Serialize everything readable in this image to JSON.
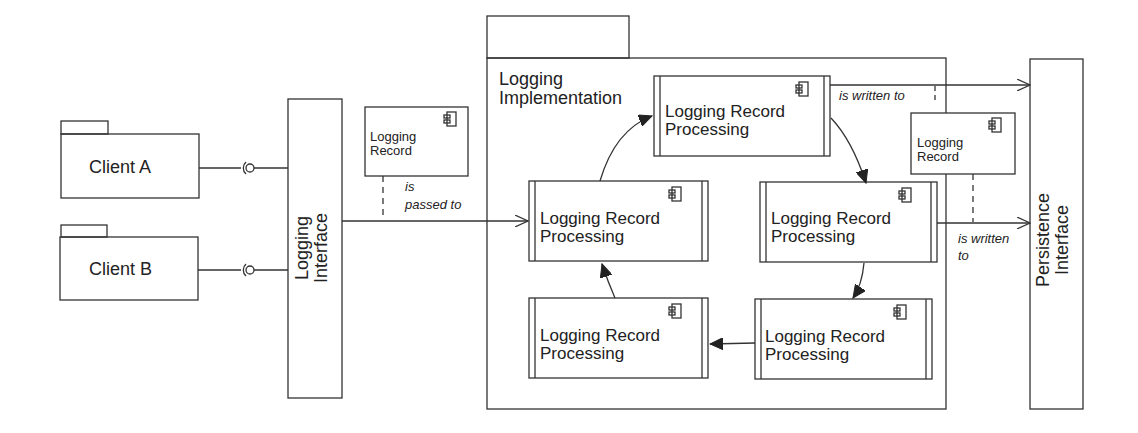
{
  "diagram": {
    "type": "UML component/package diagram",
    "clients": [
      {
        "label": "Client A"
      },
      {
        "label": "Client B"
      }
    ],
    "logging_interface": {
      "label_line1": "Logging",
      "label_line2": "Interface"
    },
    "persistence_interface": {
      "label_line1": "Persistence",
      "label_line2": "Interface"
    },
    "logging_record_notes": [
      {
        "line1": "Logging",
        "line2": "Record"
      },
      {
        "line1": "Logging",
        "line2": "Record"
      }
    ],
    "implementation_package": {
      "label_line1": "Logging",
      "label_line2": "Implementation"
    },
    "processing_components": [
      {
        "line1": "Logging Record",
        "line2": "Processing"
      },
      {
        "line1": "Logging Record",
        "line2": "Processing"
      },
      {
        "line1": "Logging Record",
        "line2": "Processing"
      },
      {
        "line1": "Logging Record",
        "line2": "Processing"
      },
      {
        "line1": "Logging Record",
        "line2": "Processing"
      }
    ],
    "edge_labels": {
      "passed_line1": "is",
      "passed_line2": "passed to",
      "written_top": "is written to",
      "written_bottom_line1": "is written",
      "written_bottom_line2": "to"
    },
    "colors": {
      "stroke": "#333333",
      "background": "#ffffff"
    }
  }
}
